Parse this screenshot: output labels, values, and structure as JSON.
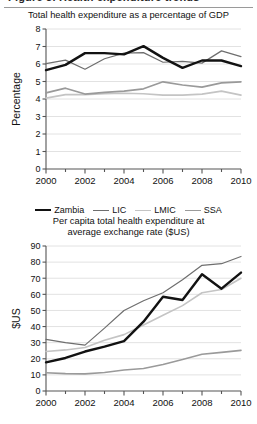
{
  "figure": {
    "top_fragment_text": "Figure 3. Health expenditure trends",
    "series_colors": {
      "Zambia": "#121212",
      "LIC": "#6e6e6e",
      "LMIC": "#c4c4c4",
      "SSA": "#9a9a9a"
    },
    "series_widths": {
      "Zambia": 2.4,
      "LIC": 1.2,
      "LMIC": 1.6,
      "SSA": 1.6
    }
  },
  "legend": {
    "items": [
      {
        "label": "Zambia",
        "color": "#121212",
        "width": 2.4
      },
      {
        "label": "LIC",
        "color": "#6e6e6e",
        "width": 1.2
      },
      {
        "label": "LMIC",
        "color": "#c4c4c4",
        "width": 1.6
      },
      {
        "label": "SSA",
        "color": "#9a9a9a",
        "width": 1.6
      }
    ]
  },
  "chart_data": [
    {
      "id": "gdp-share",
      "type": "line",
      "title": "Total health expenditure as a percentage of GDP",
      "xlabel": "",
      "ylabel": "Percentage",
      "x": [
        2000,
        2001,
        2002,
        2003,
        2004,
        2005,
        2006,
        2007,
        2008,
        2009,
        2010
      ],
      "xtick_labels": [
        "2000",
        "",
        "2002",
        "",
        "2004",
        "",
        "2006",
        "",
        "2008",
        "",
        "2010"
      ],
      "xlim": [
        2000,
        2010
      ],
      "ylim": [
        0,
        8
      ],
      "ytick_values": [
        0,
        1,
        2,
        3,
        4,
        5,
        6,
        7,
        8
      ],
      "ytick_labels": [
        "0",
        "1",
        "2",
        "3",
        "4",
        "5",
        "6",
        "7",
        "8"
      ],
      "grid": "horizontal",
      "legend_position": "below",
      "series": [
        {
          "name": "Zambia",
          "color": "#121212",
          "width": 2.4,
          "values": [
            5.65,
            5.95,
            6.62,
            6.62,
            6.55,
            7.02,
            6.35,
            5.78,
            6.2,
            6.2,
            5.88
          ]
        },
        {
          "name": "LIC",
          "color": "#6e6e6e",
          "width": 1.2,
          "values": [
            6.02,
            6.22,
            5.7,
            6.3,
            6.62,
            6.65,
            6.1,
            6.15,
            6.05,
            6.75,
            6.42
          ]
        },
        {
          "name": "LMIC",
          "color": "#c4c4c4",
          "width": 1.6,
          "values": [
            4.05,
            4.25,
            4.25,
            4.3,
            4.33,
            4.3,
            4.22,
            4.22,
            4.28,
            4.45,
            4.22
          ]
        },
        {
          "name": "SSA",
          "color": "#9a9a9a",
          "width": 1.6,
          "values": [
            4.35,
            4.62,
            4.28,
            4.38,
            4.45,
            4.58,
            4.98,
            4.8,
            4.68,
            4.92,
            4.98
          ]
        }
      ]
    },
    {
      "id": "per-capita-usd",
      "type": "line",
      "title": "Per capita total health expenditure at average exchange rate ($US)",
      "title_line1": "Per capita total health expenditure at",
      "title_line2": "average exchange rate ($US)",
      "xlabel": "",
      "ylabel": "$US",
      "x": [
        2000,
        2001,
        2002,
        2003,
        2004,
        2005,
        2006,
        2007,
        2008,
        2009,
        2010
      ],
      "xtick_labels": [
        "2000",
        "",
        "2002",
        "",
        "2004",
        "",
        "2006",
        "",
        "2008",
        "",
        "2010"
      ],
      "xlim": [
        2000,
        2010
      ],
      "ylim": [
        0,
        90
      ],
      "ytick_values": [
        0,
        10,
        20,
        30,
        40,
        50,
        60,
        70,
        80,
        90
      ],
      "ytick_labels": [
        "0",
        "10",
        "20",
        "30",
        "40",
        "50",
        "60",
        "70",
        "80",
        "90"
      ],
      "grid": "horizontal",
      "legend_position": "above",
      "series": [
        {
          "name": "Zambia",
          "color": "#121212",
          "width": 2.4,
          "values": [
            17.8,
            20.5,
            24.5,
            27.5,
            31.0,
            43.0,
            58.5,
            56.5,
            72.5,
            63.5,
            73.5
          ]
        },
        {
          "name": "LIC",
          "color": "#6e6e6e",
          "width": 1.2,
          "values": [
            32.0,
            30.0,
            28.5,
            39.0,
            50.0,
            56.0,
            61.0,
            69.0,
            78.0,
            79.0,
            83.5
          ]
        },
        {
          "name": "LMIC",
          "color": "#c4c4c4",
          "width": 1.6,
          "values": [
            24.5,
            25.5,
            27.0,
            31.5,
            35.0,
            41.0,
            47.0,
            53.0,
            61.0,
            63.0,
            70.0
          ]
        },
        {
          "name": "SSA",
          "color": "#9a9a9a",
          "width": 1.6,
          "values": [
            11.3,
            10.8,
            10.6,
            11.5,
            13.0,
            14.0,
            16.5,
            19.5,
            22.8,
            24.0,
            25.2
          ]
        }
      ]
    }
  ]
}
